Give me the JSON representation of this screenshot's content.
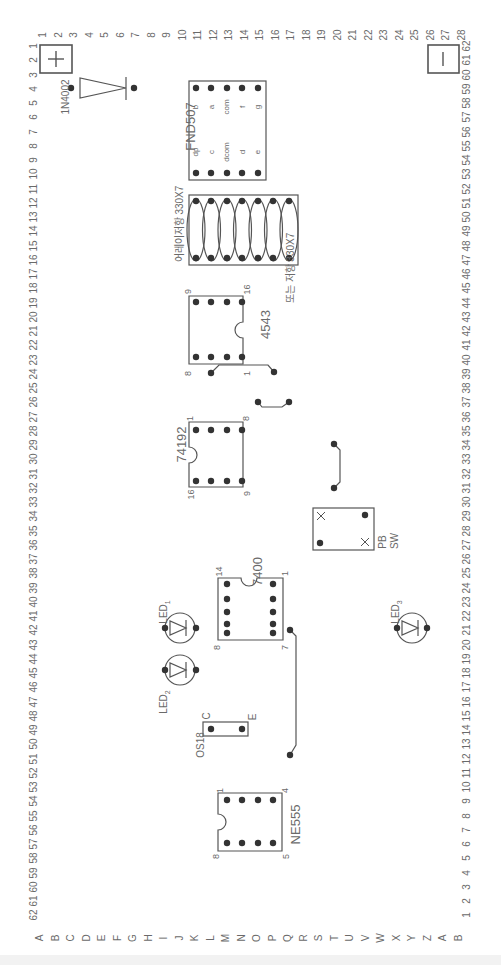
{
  "board": {
    "title": "Breadboard component layout",
    "orientation": "rotated 90 degrees clockwise",
    "top_numbers": [
      "1",
      "2",
      "3",
      "4",
      "5",
      "6",
      "7",
      "8",
      "9",
      "10",
      "11",
      "12",
      "13",
      "14",
      "15",
      "16",
      "17",
      "18",
      "19",
      "20",
      "21",
      "22",
      "23",
      "24",
      "25",
      "26",
      "27",
      "28"
    ],
    "left_numbers": [
      "1",
      "2",
      "3",
      "4",
      "5",
      "6",
      "7",
      "8",
      "9",
      "10",
      "11",
      "12",
      "13",
      "14",
      "15",
      "16",
      "17",
      "18",
      "19",
      "20",
      "21",
      "22",
      "23",
      "24",
      "25",
      "26",
      "27",
      "28",
      "29",
      "30",
      "31",
      "32",
      "33",
      "34",
      "35",
      "36",
      "37",
      "38",
      "39",
      "40",
      "41",
      "42",
      "43",
      "44",
      "45",
      "46",
      "47",
      "48",
      "49",
      "50",
      "51",
      "52",
      "53",
      "54",
      "55",
      "56",
      "57",
      "58",
      "59",
      "60",
      "61",
      "62"
    ],
    "right_numbers": [
      "62",
      "61",
      "60",
      "59",
      "58",
      "57",
      "56",
      "55",
      "54",
      "53",
      "52",
      "51",
      "50",
      "49",
      "48",
      "47",
      "46",
      "45",
      "44",
      "43",
      "42",
      "41",
      "40",
      "39",
      "38",
      "37",
      "36",
      "35",
      "34",
      "33",
      "32",
      "31",
      "30",
      "29",
      "28",
      "27",
      "26",
      "25",
      "24",
      "23",
      "22",
      "21",
      "20",
      "19",
      "18",
      "17",
      "16",
      "15",
      "14",
      "13",
      "12",
      "11",
      "10",
      "9",
      "8",
      "7",
      "6",
      "5",
      "4",
      "3",
      "2",
      "1"
    ],
    "bottom_letters": [
      "A",
      "B",
      "C",
      "D",
      "E",
      "F",
      "G",
      "H",
      "I",
      "J",
      "K",
      "L",
      "M",
      "N",
      "O",
      "P",
      "Q",
      "R",
      "S",
      "T",
      "U",
      "V",
      "W",
      "X",
      "Y",
      "Z",
      "A",
      "B"
    ],
    "colors": {
      "line": "#555555",
      "dot": "#333333",
      "text": "#666666",
      "background": "#ffffff"
    }
  },
  "power": {
    "plus": {
      "symbol": "+"
    },
    "minus": {
      "symbol": "−"
    }
  },
  "components": {
    "diode": {
      "label": "1N4002"
    },
    "display": {
      "label": "FND507",
      "top_pins": [
        "b",
        "a",
        "com",
        "f",
        "g"
      ],
      "bottom_pins": [
        "dp",
        "c",
        "dcom",
        "d",
        "e"
      ]
    },
    "resistor_array": {
      "label_top": "어레이저항 330X7",
      "label_bottom": "또는 저항 330X7",
      "count": 7
    },
    "ic_4543": {
      "label": "4543",
      "pin_top_left": "9",
      "pin_bottom_left": "8",
      "pin_top_right": "16",
      "pin_bottom_right": "1"
    },
    "ic_74192": {
      "label": "74192",
      "pin_top_left": "1",
      "pin_bottom_left": "16",
      "pin_top_right": "8",
      "pin_bottom_right": "9"
    },
    "push_switch": {
      "label_line1": "PB",
      "label_line2": "SW"
    },
    "ic_7400": {
      "label": "7400",
      "pin_top_left": "14",
      "pin_top_right": "1",
      "pin_bottom_left": "8",
      "pin_bottom_right": "7"
    },
    "led1": {
      "label": "LED",
      "sub": "1"
    },
    "led2": {
      "label": "LED",
      "sub": "2"
    },
    "led3": {
      "label": "LED",
      "sub": "3"
    },
    "transistor": {
      "label": "OS18",
      "pin_c": "C",
      "pin_e": "E"
    },
    "ic_ne555": {
      "label": "NE555",
      "pin_top_left": "1",
      "pin_bottom_left": "8",
      "pin_top_right": "4",
      "pin_bottom_right": "5"
    }
  }
}
